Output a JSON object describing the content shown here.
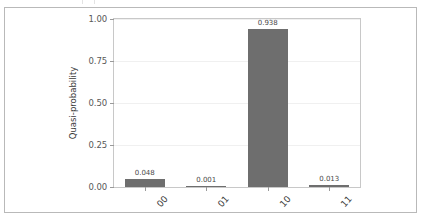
{
  "chart_data": {
    "type": "bar",
    "title": "",
    "xlabel": "",
    "ylabel": "Quasi-probability",
    "categories": [
      "00",
      "01",
      "10",
      "11"
    ],
    "values": [
      0.048,
      0.001,
      0.938,
      0.013
    ],
    "value_labels": [
      "0.048",
      "0.001",
      "0.938",
      "0.013"
    ],
    "ylim": [
      0.0,
      1.0
    ],
    "ytick_labels": [
      "0.00",
      "0.25",
      "0.50",
      "0.75",
      "1.00"
    ],
    "ytick_values": [
      0.0,
      0.25,
      0.5,
      0.75,
      1.0
    ],
    "grid": "horizontal",
    "legend": "none",
    "bar_color": "#6e6e6e",
    "xtick_rotation": "-48",
    "background_color": "#ffffff",
    "frame_color": "#b9b9b9"
  }
}
